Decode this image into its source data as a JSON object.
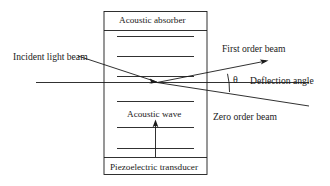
{
  "figure": {
    "type": "acousto-optic-modulator-schematic",
    "background_color": "#ffffff",
    "line_color": "#1a1a1a",
    "text_color": "#1a1a1a"
  },
  "cell": {
    "top_label": "Acoustic absorber",
    "bottom_label": "Piezoelectric transducer",
    "middle_label": "Acoustic wave",
    "acoustic_fringe_count": 7
  },
  "labels": {
    "incident": "Incident light beam",
    "first_order": "First order beam",
    "zero_order": "Zero order beam",
    "deflection": "Deflection angle",
    "theta": "θ"
  }
}
